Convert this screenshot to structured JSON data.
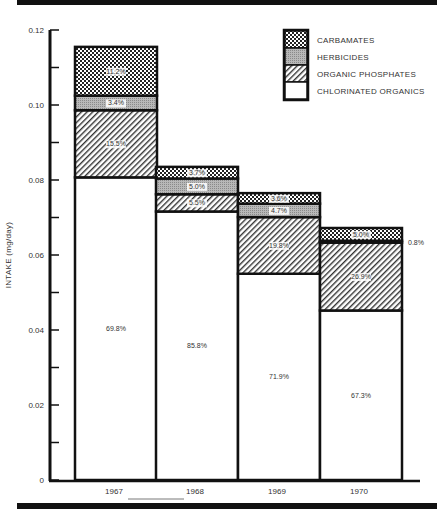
{
  "chart_data": {
    "type": "bar",
    "stacked": true,
    "title": "",
    "xlabel": "",
    "ylabel": "INTAKE (mg/day)",
    "ylim": [
      0,
      0.12
    ],
    "yticks": [
      "0",
      "0.02",
      "0.04",
      "0.06",
      "0.08",
      "0.10",
      "0.12"
    ],
    "grid": false,
    "legend_position": "top-right",
    "categories": [
      "1967",
      "1968",
      "1969",
      "1970"
    ],
    "series": [
      {
        "name": "CHLORINATED ORGANICS",
        "pattern": "white",
        "values": [
          0.0807,
          0.0716,
          0.055,
          0.0452
        ],
        "percent_labels": [
          "69.8%",
          "85.8%",
          "71.9%",
          "67.3%"
        ]
      },
      {
        "name": "ORGANIC PHOSPHATES",
        "pattern": "diagonal-hatch",
        "values": [
          0.0179,
          0.0046,
          0.0151,
          0.0181
        ],
        "percent_labels": [
          "15.5%",
          "5.5%",
          "19.8%",
          "26.9%"
        ]
      },
      {
        "name": "HERBICIDES",
        "pattern": "gray-stipple",
        "values": [
          0.0039,
          0.0042,
          0.0036,
          0.0005
        ],
        "percent_labels": [
          "3.4%",
          "5.0%",
          "4.7%",
          "0.8%"
        ]
      },
      {
        "name": "CARBAMATES",
        "pattern": "cross-hatch",
        "values": [
          0.013,
          0.0031,
          0.0028,
          0.0034
        ],
        "percent_labels": [
          "11.2%",
          "3.7%",
          "3.6%",
          "5.0%"
        ]
      }
    ],
    "totals": [
      0.1157,
      0.0835,
      0.0765,
      0.0672
    ]
  },
  "legend": {
    "items": [
      {
        "label": "CARBAMATES",
        "pattern": "cross-hatch"
      },
      {
        "label": "HERBICIDES",
        "pattern": "gray-stipple"
      },
      {
        "label": "ORGANIC PHOSPHATES",
        "pattern": "diagonal-hatch"
      },
      {
        "label": "CHLORINATED ORGANICS",
        "pattern": "white"
      }
    ]
  },
  "axis": {
    "ylabel": "INTAKE (mg/day)",
    "yticks": [
      "0",
      "0.02",
      "0.04",
      "0.06",
      "0.08",
      "0.10",
      "0.12"
    ],
    "xticks": [
      "1967",
      "1968",
      "1969",
      "1970"
    ]
  }
}
